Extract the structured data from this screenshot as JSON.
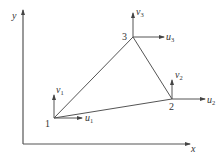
{
  "diagram": {
    "type": "triangular-element-nodal-displacements",
    "axes": {
      "x_label": "x",
      "y_label": "y",
      "origin": [
        23,
        144
      ],
      "x_end": [
        190,
        144
      ],
      "y_end": [
        23,
        10
      ]
    },
    "nodes": [
      {
        "id": "1",
        "label": "1",
        "pos": [
          54,
          118
        ],
        "label_pos": [
          45,
          127
        ],
        "u": {
          "label": "u",
          "sub": "1",
          "end": [
            82,
            118
          ],
          "text_pos": [
            85,
            121
          ]
        },
        "v": {
          "label": "v",
          "sub": "1",
          "end": [
            54,
            95
          ],
          "text_pos": [
            56,
            93
          ]
        }
      },
      {
        "id": "2",
        "label": "2",
        "pos": [
          172,
          99
        ],
        "label_pos": [
          169,
          110
        ],
        "u": {
          "label": "u",
          "sub": "2",
          "end": [
            205,
            99
          ],
          "text_pos": [
            207,
            103
          ]
        },
        "v": {
          "label": "v",
          "sub": "2",
          "end": [
            172,
            80
          ],
          "text_pos": [
            175,
            78
          ]
        },
        "note": ""
      },
      {
        "id": "3",
        "label": "3",
        "pos": [
          133,
          37
        ],
        "label_pos": [
          122,
          40
        ],
        "u": {
          "label": "u",
          "sub": "3",
          "end": [
            164,
            37
          ],
          "text_pos": [
            166,
            40
          ]
        },
        "v": {
          "label": "v",
          "sub": "3",
          "end": [
            133,
            13
          ],
          "text_pos": [
            136,
            15
          ]
        }
      }
    ],
    "edges": [
      [
        "1",
        "2"
      ],
      [
        "2",
        "3"
      ],
      [
        "3",
        "1"
      ]
    ],
    "colors": {
      "line": "#555555",
      "text": "#333333",
      "background": "#ffffff"
    }
  }
}
